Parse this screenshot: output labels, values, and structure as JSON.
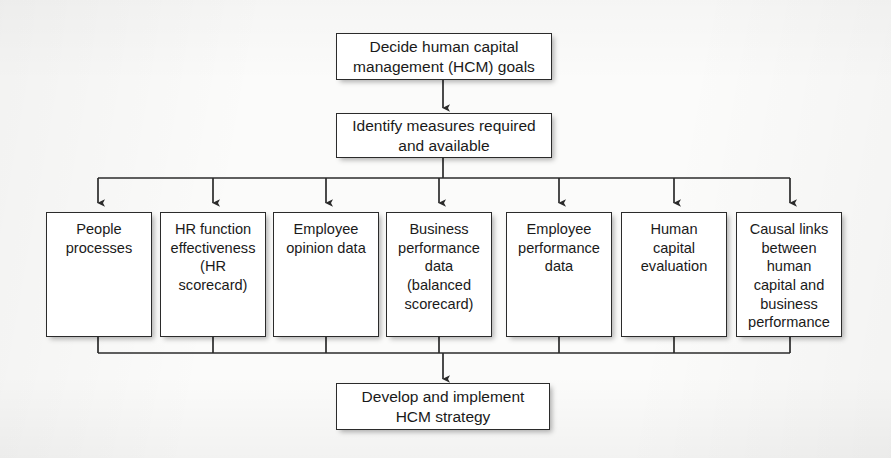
{
  "diagram": {
    "background_color": "#fbfbfa",
    "line_color": "#2b2b2b",
    "box_fill": "#ffffff",
    "text_color": "#1a1a1a"
  },
  "stages": {
    "start": {
      "label": "Decide human capital\nmanagement (HCM) goals"
    },
    "measures": {
      "label": "Identify measures required\nand available"
    },
    "end": {
      "label": "Develop and implement\nHCM strategy"
    }
  },
  "measure_boxes": [
    {
      "label": "People\nprocesses"
    },
    {
      "label": "HR function\neffectiveness\n(HR\nscorecard)"
    },
    {
      "label": "Employee\nopinion data"
    },
    {
      "label": "Business\nperformance\ndata\n(balanced\nscorecard)"
    },
    {
      "label": "Employee\nperformance\ndata"
    },
    {
      "label": "Human\ncapital\nevaluation"
    },
    {
      "label": "Causal links\nbetween\nhuman\ncapital and\nbusiness\nperformance"
    }
  ],
  "connectors": {
    "start_to_measures": "arrow-down",
    "measures_to_fanout": "arrow-down-bus",
    "boxes_to_merge": "merge-bus",
    "merge_to_end": "arrow-down"
  }
}
